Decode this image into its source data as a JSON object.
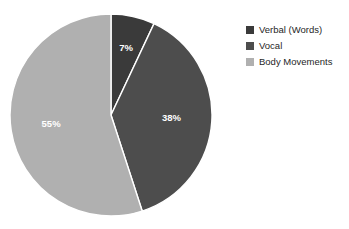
{
  "chart_data": {
    "type": "pie",
    "title": "",
    "labels": [
      "Verbal (Words)",
      "Vocal",
      "Body Movements"
    ],
    "values": [
      7,
      38,
      55
    ],
    "value_labels": [
      "7%",
      "38%",
      "55%"
    ],
    "unit": "%",
    "total": 100,
    "start_angle_deg": 0,
    "direction": "clockwise",
    "colors": [
      "#3a3a3a",
      "#4d4d4d",
      "#b0b0b0"
    ],
    "legend_position": "right",
    "grid": false,
    "xlabel": "",
    "ylabel": "",
    "slice_label_color": "#ffffff",
    "separator_color": "#ffffff",
    "background": "#ffffff"
  },
  "legend": {
    "items": [
      {
        "label": "Verbal (Words)",
        "color": "#3a3a3a",
        "swatch": "legend-swatch-verbal"
      },
      {
        "label": "Vocal",
        "color": "#4d4d4d",
        "swatch": "legend-swatch-vocal"
      },
      {
        "label": "Body Movements",
        "color": "#b0b0b0",
        "swatch": "legend-swatch-body"
      }
    ]
  },
  "pie": {
    "slices": [
      {
        "name": "Verbal (Words)",
        "value": 7,
        "label": "7%"
      },
      {
        "name": "Vocal",
        "value": 38,
        "label": "38%"
      },
      {
        "name": "Body Movements",
        "value": 55,
        "label": "55%"
      }
    ]
  }
}
